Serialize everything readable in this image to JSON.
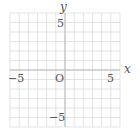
{
  "chart_data": {
    "type": "scatter",
    "title": "",
    "xlabel": "x",
    "ylabel": "y",
    "xlim": [
      -6,
      6
    ],
    "ylim": [
      -6,
      6
    ],
    "grid": true,
    "grid_step": 1,
    "origin_label": "O",
    "x_ticks": [
      {
        "value": -5,
        "label": "−5"
      },
      {
        "value": 5,
        "label": "5"
      }
    ],
    "y_ticks": [
      {
        "value": 5,
        "label": "5"
      },
      {
        "value": -5,
        "label": "−5"
      }
    ],
    "series": []
  },
  "colors": {
    "grid": "#dcdcdc",
    "axis": "#b8b8b8",
    "text": "#555555",
    "background": "#ffffff"
  }
}
